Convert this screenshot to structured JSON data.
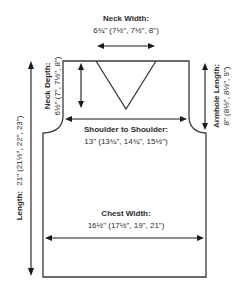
{
  "diagram": {
    "type": "knitting-schematic",
    "measurements": {
      "neck_width": {
        "label": "Neck Width:",
        "value": "6¾\" (7½\", 7½\", 8\")"
      },
      "neck_depth": {
        "label": "Neck Depth:",
        "value": "6½\" (7\", 7½\", 8\")"
      },
      "armhole_length": {
        "label": "Armhole Length:",
        "value": "8\" (8½\", 8½\", 9\")"
      },
      "shoulder_to_shoulder": {
        "label": "Shoulder to Shoulder:",
        "value": "13\" (13¾\", 14¾\", 15½\")"
      },
      "chest_width": {
        "label": "Chest Width:",
        "value": "16½\" (17½\", 19\", 21\")"
      },
      "length": {
        "label": "Length:",
        "value": "21\" (21½\", 22\", 23\")"
      }
    },
    "colors": {
      "outline": "#3a3a3a",
      "arrows": "#1a1a1a",
      "text": "#2b2b2b",
      "background": "#ffffff"
    }
  }
}
